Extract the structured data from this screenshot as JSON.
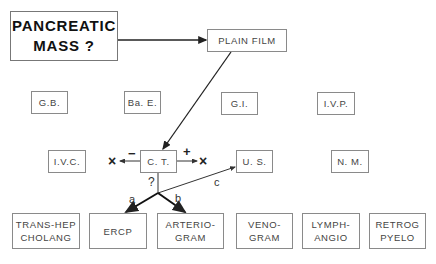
{
  "diagram": {
    "start": {
      "label": "PANCREATIC\nMASS ?"
    },
    "plain_film": {
      "label": "PLAIN FILM"
    },
    "row1": [
      {
        "label": "G.B."
      },
      {
        "label": "Ba. E."
      },
      {
        "label": "G.I."
      },
      {
        "label": "I.V.P."
      }
    ],
    "row2": [
      {
        "label": "I.V.C."
      },
      {
        "label": "C. T."
      },
      {
        "label": "U. S."
      },
      {
        "label": "N. M."
      }
    ],
    "row3": [
      {
        "label": "TRANS-HEP\nCHOLANG"
      },
      {
        "label": "ERCP"
      },
      {
        "label": "ARTERIO-\nGRAM"
      },
      {
        "label": "VENO-\nGRAM"
      },
      {
        "label": "LYMPH-\nANGIO"
      },
      {
        "label": "RETROG\nPYELO"
      }
    ],
    "ct_outcomes": {
      "negative_sign": "−",
      "positive_sign": "+",
      "negative_end": "×",
      "positive_end": "×",
      "question": "?"
    },
    "branch_labels": {
      "a": "a",
      "b": "b",
      "c": "c"
    }
  }
}
